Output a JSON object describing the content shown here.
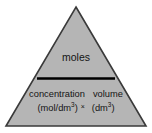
{
  "diagram": {
    "name": "moles formula triangle",
    "shape": "triangle",
    "colors": {
      "fill": "#b5b5b5",
      "stroke": "#3a3a3a",
      "divider": "#000000",
      "background": "#ffffff",
      "text": "#141414"
    },
    "numerator": {
      "label": "moles"
    },
    "divider": {
      "name": "division-bar"
    },
    "denominator": {
      "left": {
        "name": "concentration",
        "unit": "(mol/dm",
        "unit_exponent": "3",
        "unit_close": ")"
      },
      "operator": "×",
      "right": {
        "name": "volume",
        "unit": "(dm",
        "unit_exponent": "3",
        "unit_close": ")"
      }
    }
  }
}
